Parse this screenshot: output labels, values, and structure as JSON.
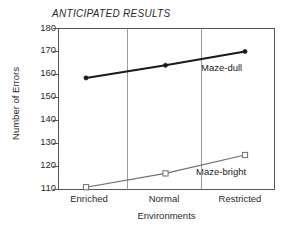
{
  "chart_data": {
    "type": "line",
    "title": "ANTICIPATED RESULTS",
    "xlabel": "Environments",
    "ylabel": "Number of Errors",
    "categories": [
      "Enriched",
      "Normal",
      "Restricted"
    ],
    "ylim": [
      110,
      180
    ],
    "yticks": [
      110,
      120,
      130,
      140,
      150,
      160,
      170,
      180
    ],
    "grid": "vertical-separators-only",
    "legend": "inline-series-labels",
    "series": [
      {
        "name": "Maze-dull",
        "values": [
          158.5,
          164,
          170
        ],
        "marker": "filled-circle",
        "color": "#1a1a1a",
        "line_width": 2.1
      },
      {
        "name": "Maze-bright",
        "values": [
          111,
          117,
          125
        ],
        "marker": "open-square",
        "color": "#6e6e6e",
        "line_width": 1.1
      }
    ]
  },
  "axis": {
    "ytick_labels": [
      "180",
      "170",
      "160",
      "150",
      "140",
      "130",
      "120",
      "110"
    ],
    "xtick_labels": [
      "Enriched",
      "Normal",
      "Restricted"
    ]
  },
  "labels": {
    "maze_dull": "Maze-dull",
    "maze_bright": "Maze-bright"
  }
}
